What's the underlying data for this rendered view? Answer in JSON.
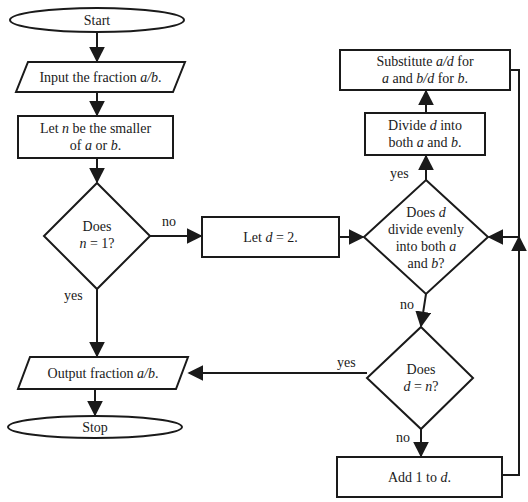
{
  "diagram": {
    "type": "flowchart",
    "nodes": {
      "start": {
        "shape": "terminal",
        "text": "Start"
      },
      "input": {
        "shape": "io",
        "pre": "Input the fraction ",
        "var": "a/b",
        "post": "."
      },
      "let_n": {
        "shape": "process",
        "l1_pre": "Let ",
        "l1_var": "n",
        "l1_post": " be the smaller",
        "l2_pre": "of ",
        "l2_var1": "a",
        "l2_mid": " or ",
        "l2_var2": "b",
        "l2_post": "."
      },
      "n_is_1": {
        "shape": "decision",
        "l1": "Does",
        "l2_var": "n",
        "l2_post": " = 1?"
      },
      "let_d": {
        "shape": "process",
        "pre": "Let ",
        "var": "d",
        "post": " = 2."
      },
      "divides": {
        "shape": "decision",
        "l1_pre": "Does ",
        "l1_var": "d",
        "l2": "divide evenly",
        "l3_pre": "into both ",
        "l3_var": "a",
        "l4_pre": "and ",
        "l4_var": "b",
        "l4_post": "?"
      },
      "divide": {
        "shape": "process",
        "l1_pre": "Divide ",
        "l1_var": "d",
        "l1_post": " into",
        "l2_pre": "both ",
        "l2_var1": "a",
        "l2_mid": " and ",
        "l2_var2": "b",
        "l2_post": "."
      },
      "substitute": {
        "shape": "process",
        "l1_pre": "Substitute ",
        "l1_var": "a/d",
        "l1_post": " for",
        "l2_var1": "a",
        "l2_mid": " and ",
        "l2_var2": "b/d",
        "l2_mid2": " for ",
        "l2_var3": "b",
        "l2_post": "."
      },
      "d_is_n": {
        "shape": "decision",
        "l1": "Does",
        "l2_var": "d",
        "l2_mid": " = ",
        "l2_var2": "n",
        "l2_post": "?"
      },
      "add": {
        "shape": "process",
        "pre": "Add 1 to ",
        "var": "d",
        "post": "."
      },
      "output": {
        "shape": "io",
        "pre": "Output fraction ",
        "var": "a/b",
        "post": "."
      },
      "stop": {
        "shape": "terminal",
        "text": "Stop"
      }
    },
    "edge_labels": {
      "n1_no": "no",
      "n1_yes": "yes",
      "div_yes": "yes",
      "div_no": "no",
      "dn_yes": "yes",
      "dn_no": "no"
    },
    "edges": [
      [
        "start",
        "input"
      ],
      [
        "input",
        "let_n"
      ],
      [
        "let_n",
        "n_is_1"
      ],
      [
        "n_is_1",
        "let_d",
        "no"
      ],
      [
        "n_is_1",
        "output",
        "yes"
      ],
      [
        "let_d",
        "divides"
      ],
      [
        "divides",
        "divide",
        "yes"
      ],
      [
        "divides",
        "d_is_n",
        "no"
      ],
      [
        "divide",
        "substitute"
      ],
      [
        "substitute",
        "divides"
      ],
      [
        "d_is_n",
        "output",
        "yes"
      ],
      [
        "d_is_n",
        "add",
        "no"
      ],
      [
        "add",
        "divides"
      ],
      [
        "output",
        "stop"
      ]
    ]
  }
}
